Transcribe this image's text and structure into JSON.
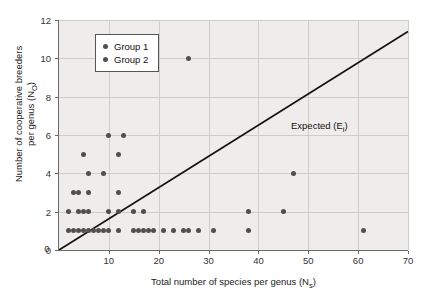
{
  "chart_data": {
    "type": "scatter",
    "title": "",
    "xlabel": "Total number of species per genus (N_s)",
    "xlabel_main": "Total number of species per genus (N",
    "xlabel_sub": "s",
    "xlabel_tail": ")",
    "ylabel": "Number of cooperative breeders per genus (N_O)",
    "ylabel_line1": "Number of cooperative breeders",
    "ylabel_line2_main": "per genus (N",
    "ylabel_line2_sub": "O",
    "ylabel_line2_tail": ")",
    "xlim": [
      0,
      70
    ],
    "ylim": [
      0,
      12
    ],
    "xticks": [
      0,
      10,
      20,
      30,
      40,
      50,
      60,
      70
    ],
    "yticks": [
      0,
      2,
      4,
      6,
      8,
      10,
      12
    ],
    "xtick_labels": [
      "0",
      "10",
      "20",
      "30",
      "40",
      "50",
      "60",
      "70"
    ],
    "ytick_labels": [
      "0",
      "2",
      "4",
      "6",
      "8",
      "10",
      "12"
    ],
    "grid": true,
    "grid_color": "#cfcdcb",
    "panel_color": "#eeedec",
    "marker_color": "#4f4f4f",
    "line_color": "#111111",
    "legend_position": "upper-left",
    "legend_entries": [
      {
        "label": "Group 1",
        "color": "#4f4f4f",
        "marker": "circle"
      },
      {
        "label": "Group 2",
        "color": "#4f4f4f",
        "marker": "circle"
      }
    ],
    "annotations": [
      {
        "text": "Expected (E_i)",
        "text_main": "Expected (E",
        "text_sub": "i",
        "text_tail": ")",
        "x": 34,
        "y": 7
      }
    ],
    "reference_line": {
      "name": "Expected (E_i)",
      "type": "linear",
      "x_start": 0,
      "y_start": 0,
      "x_end": 70,
      "y_end": 11.4,
      "slope": 0.1629
    },
    "series": [
      {
        "name": "Observed genera",
        "marker": "circle",
        "color": "#4f4f4f",
        "points": [
          [
            2,
            1
          ],
          [
            3,
            1
          ],
          [
            4,
            1
          ],
          [
            5,
            1
          ],
          [
            6,
            1
          ],
          [
            7,
            1
          ],
          [
            8,
            1
          ],
          [
            9,
            1
          ],
          [
            10,
            1
          ],
          [
            12,
            1
          ],
          [
            15,
            1
          ],
          [
            16,
            1
          ],
          [
            17,
            1
          ],
          [
            18,
            1
          ],
          [
            19,
            1
          ],
          [
            21,
            1
          ],
          [
            23,
            1
          ],
          [
            25,
            1
          ],
          [
            26,
            1
          ],
          [
            28,
            1
          ],
          [
            31,
            1
          ],
          [
            38,
            1
          ],
          [
            61,
            1
          ],
          [
            2,
            2
          ],
          [
            4,
            2
          ],
          [
            5,
            2
          ],
          [
            6,
            2
          ],
          [
            10,
            2
          ],
          [
            12,
            2
          ],
          [
            15,
            2
          ],
          [
            17,
            2
          ],
          [
            38,
            2
          ],
          [
            45,
            2
          ],
          [
            3,
            3
          ],
          [
            4,
            3
          ],
          [
            6,
            3
          ],
          [
            12,
            3
          ],
          [
            6,
            4
          ],
          [
            9,
            4
          ],
          [
            47,
            4
          ],
          [
            5,
            5
          ],
          [
            12,
            5
          ],
          [
            10,
            6
          ],
          [
            13,
            6
          ],
          [
            26,
            10
          ]
        ]
      }
    ]
  }
}
